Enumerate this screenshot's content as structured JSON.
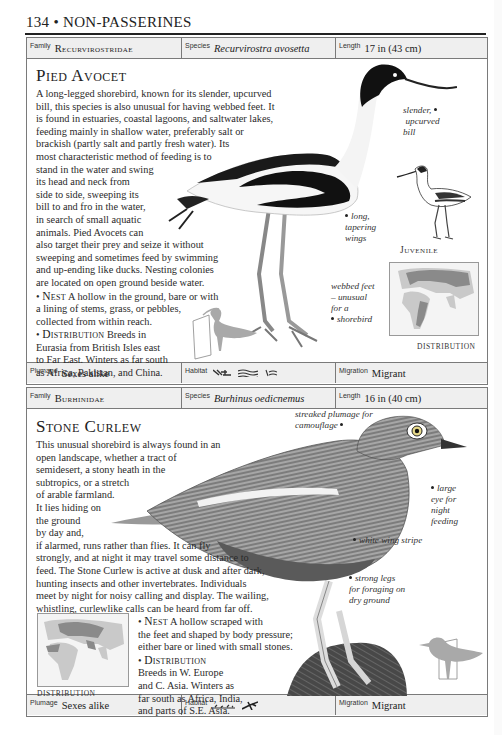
{
  "page": {
    "number": "134",
    "section": "NON-PASSERINES",
    "header": "134 • NON-PASSERINES"
  },
  "entries": [
    {
      "id": "pied-avocet",
      "top_bar": {
        "family_label": "Family",
        "family_value": "Recurvirostridae",
        "species_label": "Species",
        "species_value": "Recurvirostra avosetta",
        "length_label": "Length",
        "length_value": "17 in (43 cm)"
      },
      "title": "Pied Avocet",
      "description_lines": [
        "A long-legged shorebird, known for its slender, upcurved",
        "bill, this species is also unusual for having webbed feet. It",
        "is found in estuaries, coastal lagoons, and saltwater lakes,",
        "feeding mainly in shallow water, preferably salt or",
        "brackish (partly salt and partly fresh water). Its",
        "most characteristic method of feeding is to",
        "stand in the water and swing",
        "its head and neck from",
        "side to side, sweeping its",
        "bill to and fro in the water,",
        "in search of small aquatic",
        "animals. Pied Avocets can",
        "also target their prey and seize it without",
        "sweeping and sometimes feed by swimming",
        "and up-ending like ducks. Nesting colonies",
        "are located on open ground beside water."
      ],
      "nest": {
        "label": "Nest",
        "lines": [
          "A hollow in the ground, bare or with",
          "a lining of stems, grass, or pebbles,",
          "collected from within reach."
        ]
      },
      "distribution": {
        "label": "Distribution",
        "lines": [
          "Breeds in",
          "Eurasia from British Isles east",
          "to Far East. Winters as far south",
          "as Africa, Pakistan, and China."
        ]
      },
      "annotations": {
        "bill": [
          "slender,",
          "upcurved",
          "bill"
        ],
        "wings": [
          "long,",
          "tapering",
          "wings"
        ],
        "feet": [
          "webbed feet",
          "– unusual",
          "for a",
          "shorebird"
        ]
      },
      "juvenile_caption": "Juvenile",
      "map_caption": "DISTRIBUTION",
      "bottom_bar": {
        "plumage_label": "Plumage",
        "plumage_value": "Sexes alike",
        "habitat_label": "Habitat",
        "habitat_icons": [
          "marsh-icon",
          "coast-water-icon",
          "lake-icon"
        ],
        "migration_label": "Migration",
        "migration_value": "Migrant"
      }
    },
    {
      "id": "stone-curlew",
      "top_bar": {
        "family_label": "Family",
        "family_value": "Burhinidae",
        "species_label": "Species",
        "species_value": "Burhinus oedicnemus",
        "length_label": "Length",
        "length_value": "16 in (40 cm)"
      },
      "title": "Stone Curlew",
      "description_lines": [
        "This unusual shorebird is always found in an",
        "open landscape, whether a tract of",
        "semidesert, a stony heath in the",
        "subtropics, or a stretch",
        "of arable farmland.",
        "It lies hiding on",
        "the ground",
        "by day and,",
        "if alarmed, runs rather than flies. It can fly",
        "strongly, and at night it may travel some distance to",
        "feed. The Stone Curlew is active at dusk and after dark,",
        "hunting insects and other invertebrates. Individuals",
        "meet by night for noisy calling and display. The wailing,",
        "whistling, curlewlike calls can be heard from far off."
      ],
      "nest": {
        "label": "Nest",
        "lines": [
          "A hollow scraped with",
          "the feet and shaped by body pressure;",
          "either bare or lined with small stones."
        ]
      },
      "distribution": {
        "label": "Distribution",
        "lines": [
          "Breeds in W. Europe",
          "and C. Asia. Winters as",
          "far south as Africa, India,",
          "and parts of S.E. Asia."
        ]
      },
      "annotations": {
        "plumage": [
          "streaked plumage for",
          "camouflage"
        ],
        "eye": [
          "large",
          "eye for",
          "night",
          "feeding"
        ],
        "stripe": [
          "white wing stripe"
        ],
        "legs": [
          "strong legs",
          "for foraging on",
          "dry ground"
        ]
      },
      "map_caption": "DISTRIBUTION",
      "bottom_bar": {
        "plumage_label": "Plumage",
        "plumage_value": "Sexes alike",
        "habitat_label": "Habitat",
        "habitat_icons": [
          "ground-icon",
          "scrub-icon"
        ],
        "migration_label": "Migration",
        "migration_value": "Migrant"
      }
    }
  ],
  "colors": {
    "bar_bg": "#efefef",
    "border": "#7a7a7a",
    "map_land": "#c9c9c9",
    "map_range": "#8a8a8a",
    "silhouette": "#a9a9a9"
  }
}
